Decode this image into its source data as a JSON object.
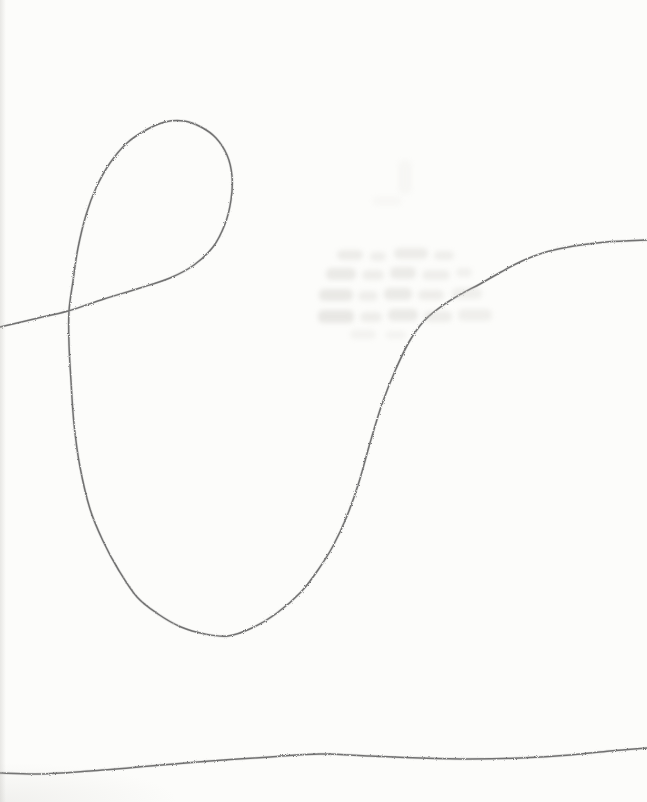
{
  "scene": {
    "type": "pencil-sketch-scan",
    "paper_color": "#fcfcfa",
    "pencil_color": "#5e5e5e",
    "width": 647,
    "height": 802
  },
  "strokes": [
    {
      "name": "loop-curve",
      "points": [
        [
          0,
          327
        ],
        [
          34,
          319
        ],
        [
          68,
          311
        ],
        [
          104,
          299
        ],
        [
          140,
          288
        ],
        [
          170,
          278
        ],
        [
          194,
          265
        ],
        [
          213,
          247
        ],
        [
          225,
          224
        ],
        [
          231,
          200
        ],
        [
          232,
          176
        ],
        [
          227,
          155
        ],
        [
          216,
          138
        ],
        [
          201,
          127
        ],
        [
          184,
          121
        ],
        [
          165,
          122
        ],
        [
          146,
          130
        ],
        [
          127,
          143
        ],
        [
          110,
          163
        ],
        [
          96,
          188
        ],
        [
          86,
          215
        ],
        [
          78,
          248
        ],
        [
          73,
          281
        ],
        [
          69,
          311
        ],
        [
          69,
          344
        ],
        [
          71,
          381
        ],
        [
          74,
          424
        ],
        [
          80,
          467
        ],
        [
          90,
          509
        ],
        [
          103,
          541
        ],
        [
          118,
          569
        ],
        [
          137,
          597
        ],
        [
          158,
          614
        ],
        [
          181,
          627
        ],
        [
          205,
          634
        ],
        [
          228,
          636
        ],
        [
          252,
          628
        ],
        [
          277,
          613
        ],
        [
          301,
          592
        ],
        [
          318,
          570
        ],
        [
          333,
          546
        ],
        [
          347,
          516
        ],
        [
          359,
          482
        ],
        [
          370,
          443
        ],
        [
          382,
          404
        ],
        [
          395,
          371
        ],
        [
          409,
          342
        ],
        [
          424,
          321
        ],
        [
          442,
          306
        ],
        [
          461,
          294
        ],
        [
          480,
          284
        ],
        [
          501,
          272
        ],
        [
          522,
          261
        ],
        [
          546,
          252
        ],
        [
          574,
          246
        ],
        [
          606,
          242
        ],
        [
          647,
          240
        ]
      ]
    },
    {
      "name": "baseline",
      "points": [
        [
          0,
          773
        ],
        [
          40,
          774
        ],
        [
          90,
          771
        ],
        [
          150,
          766
        ],
        [
          210,
          761
        ],
        [
          270,
          757
        ],
        [
          320,
          754
        ],
        [
          370,
          756
        ],
        [
          420,
          758
        ],
        [
          470,
          759
        ],
        [
          520,
          758
        ],
        [
          570,
          755
        ],
        [
          610,
          751
        ],
        [
          647,
          748
        ]
      ]
    }
  ],
  "ghost_marks": [
    {
      "x": 398,
      "y": 160,
      "w": 14,
      "h": 34,
      "o": 0.09
    },
    {
      "x": 372,
      "y": 196,
      "w": 30,
      "h": 10,
      "o": 0.08
    },
    {
      "x": 337,
      "y": 250,
      "w": 26,
      "h": 10,
      "o": 0.3
    },
    {
      "x": 370,
      "y": 252,
      "w": 16,
      "h": 9,
      "o": 0.26
    },
    {
      "x": 394,
      "y": 248,
      "w": 34,
      "h": 11,
      "o": 0.3
    },
    {
      "x": 434,
      "y": 251,
      "w": 20,
      "h": 9,
      "o": 0.26
    },
    {
      "x": 326,
      "y": 268,
      "w": 30,
      "h": 12,
      "o": 0.34
    },
    {
      "x": 362,
      "y": 270,
      "w": 22,
      "h": 10,
      "o": 0.28
    },
    {
      "x": 390,
      "y": 267,
      "w": 26,
      "h": 12,
      "o": 0.32
    },
    {
      "x": 422,
      "y": 270,
      "w": 28,
      "h": 10,
      "o": 0.26
    },
    {
      "x": 456,
      "y": 268,
      "w": 16,
      "h": 9,
      "o": 0.22
    },
    {
      "x": 319,
      "y": 289,
      "w": 34,
      "h": 12,
      "o": 0.36
    },
    {
      "x": 358,
      "y": 291,
      "w": 20,
      "h": 10,
      "o": 0.26
    },
    {
      "x": 384,
      "y": 288,
      "w": 28,
      "h": 12,
      "o": 0.34
    },
    {
      "x": 418,
      "y": 290,
      "w": 26,
      "h": 10,
      "o": 0.28
    },
    {
      "x": 452,
      "y": 288,
      "w": 30,
      "h": 11,
      "o": 0.24
    },
    {
      "x": 318,
      "y": 310,
      "w": 36,
      "h": 13,
      "o": 0.38
    },
    {
      "x": 360,
      "y": 312,
      "w": 22,
      "h": 10,
      "o": 0.28
    },
    {
      "x": 388,
      "y": 309,
      "w": 30,
      "h": 12,
      "o": 0.34
    },
    {
      "x": 424,
      "y": 311,
      "w": 28,
      "h": 11,
      "o": 0.28
    },
    {
      "x": 458,
      "y": 309,
      "w": 34,
      "h": 12,
      "o": 0.24
    },
    {
      "x": 350,
      "y": 330,
      "w": 26,
      "h": 9,
      "o": 0.18
    },
    {
      "x": 386,
      "y": 331,
      "w": 20,
      "h": 8,
      "o": 0.16
    }
  ]
}
